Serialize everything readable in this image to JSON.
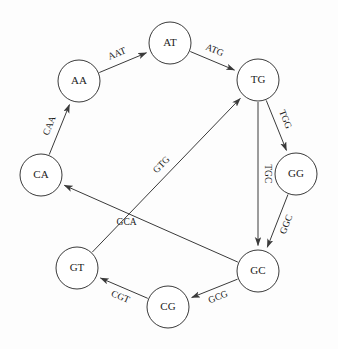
{
  "diagram": {
    "type": "directed-graph",
    "background_color": "#fdfdfd",
    "node_fill": "#ffffff",
    "stroke_color": "#3a3a3a",
    "text_color": "#1b1b1b",
    "node_radius": 21,
    "nodes": [
      {
        "id": "AA",
        "label": "AA",
        "x": 79,
        "y": 81
      },
      {
        "id": "AT",
        "label": "AT",
        "x": 170,
        "y": 43
      },
      {
        "id": "TG",
        "label": "TG",
        "x": 258,
        "y": 80
      },
      {
        "id": "GG",
        "label": "GG",
        "x": 296,
        "y": 174
      },
      {
        "id": "GC",
        "label": "GC",
        "x": 258,
        "y": 271
      },
      {
        "id": "CG",
        "label": "CG",
        "x": 168,
        "y": 307
      },
      {
        "id": "GT",
        "label": "GT",
        "x": 77,
        "y": 268
      },
      {
        "id": "CA",
        "label": "CA",
        "x": 41,
        "y": 175
      }
    ],
    "edges": [
      {
        "id": "AA-AT",
        "from": "AA",
        "to": "AT",
        "label": "AAT",
        "label_offset": -10,
        "label_pos": 0.46,
        "rotate": true
      },
      {
        "id": "AT-TG",
        "from": "AT",
        "to": "TG",
        "label": "ATG",
        "label_offset": -10,
        "label_pos": 0.46,
        "rotate": true
      },
      {
        "id": "TG-GG",
        "from": "TG",
        "to": "GG",
        "label": "TGG",
        "label_offset": -10,
        "label_pos": 0.46,
        "rotate": true
      },
      {
        "id": "TG-GC",
        "from": "TG",
        "to": "GC",
        "label": "TGC",
        "label_offset": -9,
        "label_pos": 0.5,
        "rotate": true
      },
      {
        "id": "GG-GC",
        "from": "GG",
        "to": "GC",
        "label": "GGC",
        "label_offset": -10,
        "label_pos": 0.5,
        "rotate": true
      },
      {
        "id": "GC-CG",
        "from": "GC",
        "to": "CG",
        "label": "GCG",
        "label_offset": -10,
        "label_pos": 0.5,
        "rotate": true
      },
      {
        "id": "CG-GT",
        "from": "CG",
        "to": "GT",
        "label": "CGT",
        "label_offset": -10,
        "label_pos": 0.5,
        "rotate": true
      },
      {
        "id": "GT-TG",
        "from": "GT",
        "to": "TG",
        "label": "GTG",
        "label_offset": -10,
        "label_pos": 0.52,
        "rotate": true
      },
      {
        "id": "GC-CA",
        "from": "GC",
        "to": "CA",
        "label": "GCA",
        "label_offset": -9,
        "label_pos": 0.62,
        "rotate": false
      },
      {
        "id": "CA-AA",
        "from": "CA",
        "to": "AA",
        "label": "CAA",
        "label_offset": -10,
        "label_pos": 0.5,
        "rotate": true
      }
    ]
  }
}
